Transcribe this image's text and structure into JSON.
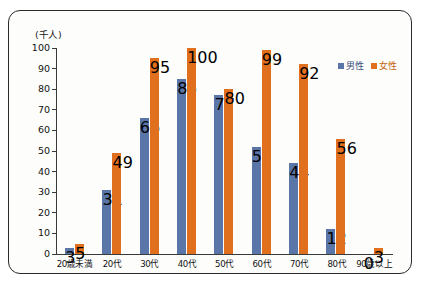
{
  "chart_data": {
    "type": "bar",
    "title": "",
    "subtitle": "",
    "unit_label": "(千人)",
    "xlabel": "",
    "ylabel": "",
    "ylim": [
      0,
      100
    ],
    "yticks": [
      0,
      10,
      20,
      30,
      40,
      50,
      60,
      70,
      80,
      90,
      100
    ],
    "grid": false,
    "legend_position": "top-right",
    "categories": [
      "20歳未満",
      "20代",
      "30代",
      "40代",
      "50代",
      "60代",
      "70代",
      "80代",
      "90歳以上"
    ],
    "series": [
      {
        "name": "男性",
        "color": "#5a75a8",
        "values": [
          3,
          31,
          66,
          85,
          77,
          52,
          44,
          12,
          0
        ]
      },
      {
        "name": "女性",
        "color": "#e1701e",
        "values": [
          5,
          49,
          95,
          100,
          80,
          99,
          92,
          56,
          3
        ]
      }
    ]
  },
  "legend": {
    "items": [
      {
        "label": "男性",
        "color": "#5a75a8"
      },
      {
        "label": "女性",
        "color": "#e1701e"
      }
    ]
  },
  "colors": {
    "male": "#5a75a8",
    "female": "#e1701e",
    "axis": "#3a3a3a",
    "frame": "#2a2a2a",
    "background": "#ffffff"
  }
}
